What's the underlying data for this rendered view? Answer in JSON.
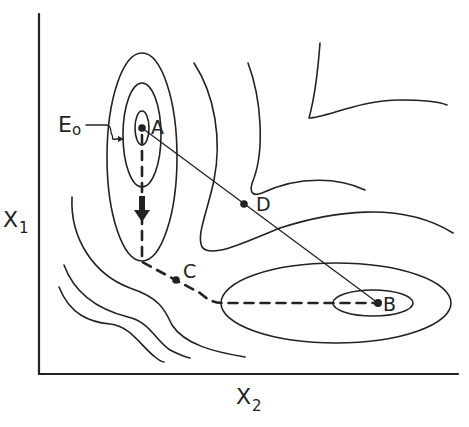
{
  "figure": {
    "type": "contour-plot-optimization-paths",
    "axes": {
      "x_label": "X",
      "x_subscript": "2",
      "y_label": "X",
      "y_subscript": "1"
    },
    "points": [
      {
        "id": "A",
        "label": "A",
        "x": 142,
        "y": 128
      },
      {
        "id": "B",
        "label": "B",
        "x": 378,
        "y": 303
      },
      {
        "id": "C",
        "label": "C",
        "x": 176,
        "y": 280
      },
      {
        "id": "D",
        "label": "D",
        "x": 244,
        "y": 204
      }
    ],
    "annotation": {
      "label": "E",
      "subscript": "o"
    },
    "paths": [
      {
        "name": "direct-line",
        "from": "A",
        "to": "B",
        "through": "D",
        "style": "solid"
      },
      {
        "name": "descent-path",
        "from": "A",
        "to": "B",
        "through": "C",
        "style": "dashed"
      }
    ],
    "colors": {
      "ink": "#222222",
      "background": "#ffffff"
    }
  }
}
